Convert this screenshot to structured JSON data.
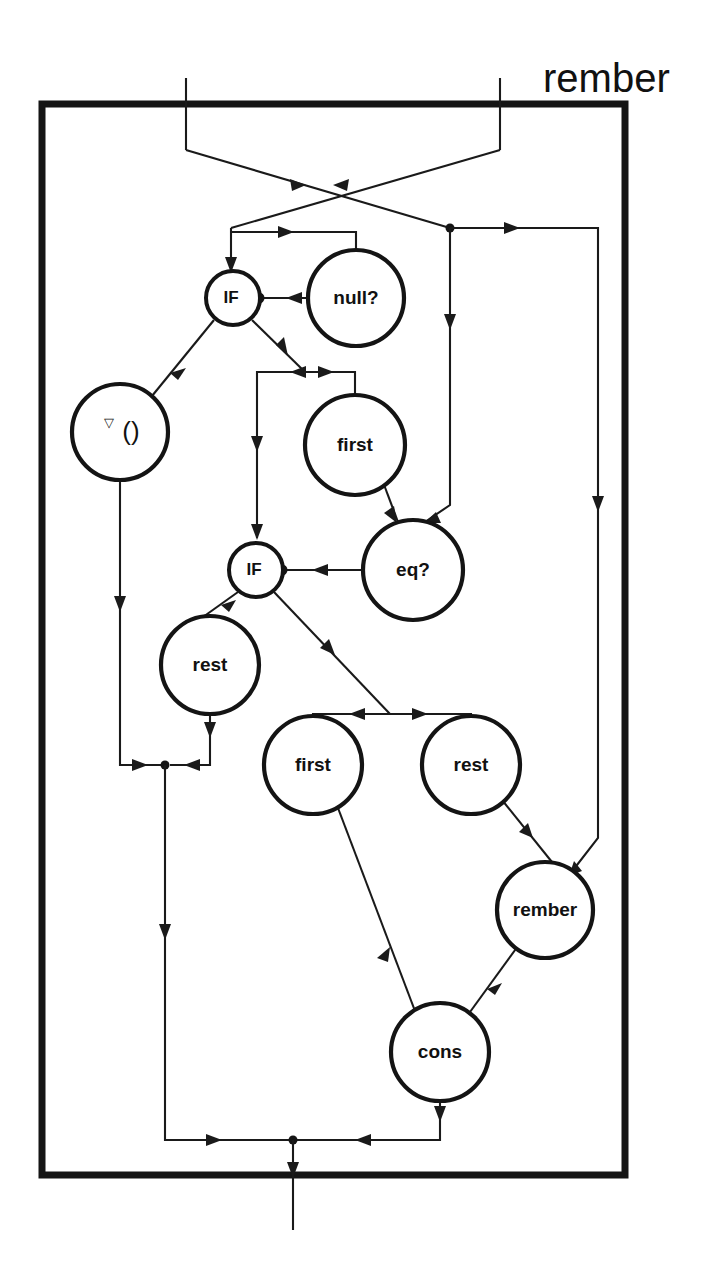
{
  "diagram": {
    "title": "rember",
    "kind": "dataflow-combinator-graph",
    "frame": {
      "x": 42,
      "y": 104,
      "width": 583,
      "height": 1071,
      "stroke": "#151515"
    },
    "palette": {
      "ink": "#1a1a1a",
      "frame": "#151515",
      "paper": "#ffffff"
    },
    "inputs": [
      {
        "name": "input-port-left",
        "x": 186,
        "y": 78
      },
      {
        "name": "input-port-right",
        "x": 500,
        "y": 78
      }
    ],
    "output": {
      "name": "output-port",
      "x": 293,
      "y": 1230
    },
    "nodes": [
      {
        "id": "if-outer",
        "label": "IF",
        "cx": 233,
        "cy": 298,
        "r": 27,
        "size": "small"
      },
      {
        "id": "null-test",
        "label": "null?",
        "cx": 356,
        "cy": 298,
        "r": 48,
        "size": "large"
      },
      {
        "id": "quote-empty",
        "label": "()",
        "sup": "▽",
        "cx": 120,
        "cy": 432,
        "r": 48,
        "size": "large"
      },
      {
        "id": "first-a",
        "label": "first",
        "cx": 355,
        "cy": 445,
        "r": 50,
        "size": "large"
      },
      {
        "id": "if-inner",
        "label": "IF",
        "cx": 256,
        "cy": 570,
        "r": 27,
        "size": "small"
      },
      {
        "id": "eq-test",
        "label": "eq?",
        "cx": 413,
        "cy": 570,
        "r": 50,
        "size": "large"
      },
      {
        "id": "rest-a",
        "label": "rest",
        "cx": 210,
        "cy": 665,
        "r": 49,
        "size": "large"
      },
      {
        "id": "first-b",
        "label": "first",
        "cx": 313,
        "cy": 765,
        "r": 49,
        "size": "large"
      },
      {
        "id": "rest-b",
        "label": "rest",
        "cx": 471,
        "cy": 765,
        "r": 49,
        "size": "large"
      },
      {
        "id": "rember-rec",
        "label": "rember",
        "cx": 545,
        "cy": 910,
        "r": 48,
        "size": "large"
      },
      {
        "id": "cons",
        "label": "cons",
        "cx": 440,
        "cy": 1052,
        "r": 49,
        "size": "large"
      }
    ],
    "junctions": [
      {
        "id": "j-right-split",
        "cx": 450,
        "cy": 228
      },
      {
        "id": "j-left-merge",
        "cx": 165,
        "cy": 765
      },
      {
        "id": "j-output",
        "cx": 293,
        "cy": 1140
      }
    ],
    "edge_count": 22
  }
}
